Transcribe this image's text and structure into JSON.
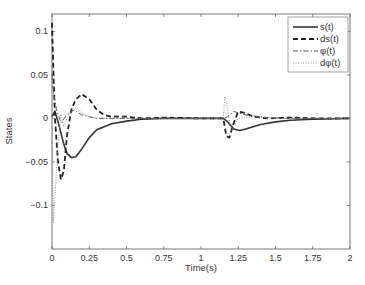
{
  "chart_data": {
    "type": "line",
    "title": "",
    "xlabel": "Time(s)",
    "ylabel": "States",
    "xlim": [
      0,
      2
    ],
    "ylim": [
      -0.15,
      0.12
    ],
    "grid": false,
    "legend_position": "upper right",
    "x_ticks": [
      "0",
      "0.25",
      "0.5",
      "0.75",
      "1",
      "1.25",
      "1.5",
      "1.75",
      "2"
    ],
    "y_ticks": [
      "0.1",
      "0.05",
      "0",
      "-0.05",
      "-0.1"
    ],
    "series": [
      {
        "name": "s(t)",
        "style": "solid",
        "x": [
          0,
          0.02,
          0.05,
          0.08,
          0.1,
          0.13,
          0.16,
          0.2,
          0.25,
          0.3,
          0.4,
          0.5,
          0.6,
          0.75,
          1.0,
          1.15,
          1.18,
          1.22,
          1.26,
          1.3,
          1.4,
          1.5,
          1.6,
          1.75,
          2.0
        ],
        "values": [
          0.002,
          0.008,
          -0.01,
          -0.03,
          -0.04,
          -0.045,
          -0.044,
          -0.035,
          -0.022,
          -0.013,
          -0.006,
          -0.003,
          -0.001,
          0.0,
          0.0,
          0.0,
          -0.004,
          -0.012,
          -0.014,
          -0.012,
          -0.007,
          -0.004,
          -0.002,
          -0.001,
          0.0
        ]
      },
      {
        "name": "ds(t)",
        "style": "dashed",
        "x": [
          0,
          0.01,
          0.02,
          0.04,
          0.06,
          0.08,
          0.1,
          0.13,
          0.16,
          0.2,
          0.25,
          0.3,
          0.35,
          0.4,
          0.5,
          0.6,
          0.75,
          1.0,
          1.15,
          1.17,
          1.19,
          1.22,
          1.25,
          1.3,
          1.35,
          1.45,
          1.6,
          1.8,
          2.0
        ],
        "values": [
          0.11,
          0.05,
          0.0,
          -0.05,
          -0.07,
          -0.06,
          -0.02,
          0.01,
          0.022,
          0.028,
          0.022,
          0.01,
          0.004,
          0.002,
          0.002,
          0.0,
          0.001,
          0.0,
          0.0,
          -0.02,
          -0.022,
          -0.005,
          0.008,
          0.006,
          0.002,
          0.0,
          0.001,
          0.0,
          0.0
        ]
      },
      {
        "name": "φ(t)",
        "style": "dashdot",
        "x": [
          0,
          0.01,
          0.03,
          0.06,
          0.1,
          0.15,
          0.2,
          0.3,
          0.4,
          0.5,
          0.75,
          1.0,
          1.15,
          1.18,
          1.22,
          1.3,
          1.45,
          1.6,
          2.0
        ],
        "values": [
          0.05,
          0.03,
          0.01,
          -0.005,
          0.004,
          0.01,
          0.004,
          0.0,
          0.0,
          0.0,
          0.0,
          0.0,
          0.0,
          0.002,
          0.008,
          0.004,
          0.001,
          0.0,
          0.0
        ]
      },
      {
        "name": "dφ(t)",
        "style": "dotted",
        "x": [
          0,
          0.01,
          0.02,
          0.04,
          0.06,
          0.08,
          0.1,
          0.13,
          0.17,
          0.2,
          0.25,
          0.3,
          0.4,
          0.5,
          0.75,
          1.0,
          1.15,
          1.16,
          1.18,
          1.2,
          1.25,
          1.35,
          1.5,
          2.0
        ],
        "values": [
          -0.005,
          -0.12,
          -0.09,
          -0.03,
          0.005,
          -0.01,
          0.0,
          0.01,
          0.012,
          0.006,
          0.002,
          0.0,
          0.0,
          0.0,
          0.0,
          0.0,
          0.0,
          0.025,
          0.01,
          -0.015,
          0.0,
          0.002,
          0.0,
          0.0
        ]
      }
    ]
  },
  "legend": {
    "items": [
      "s(t)",
      "ds(t)",
      "φ(t)",
      "dφ(t)"
    ]
  },
  "axes": {
    "xlabel": "Time(s)",
    "ylabel": "States"
  }
}
